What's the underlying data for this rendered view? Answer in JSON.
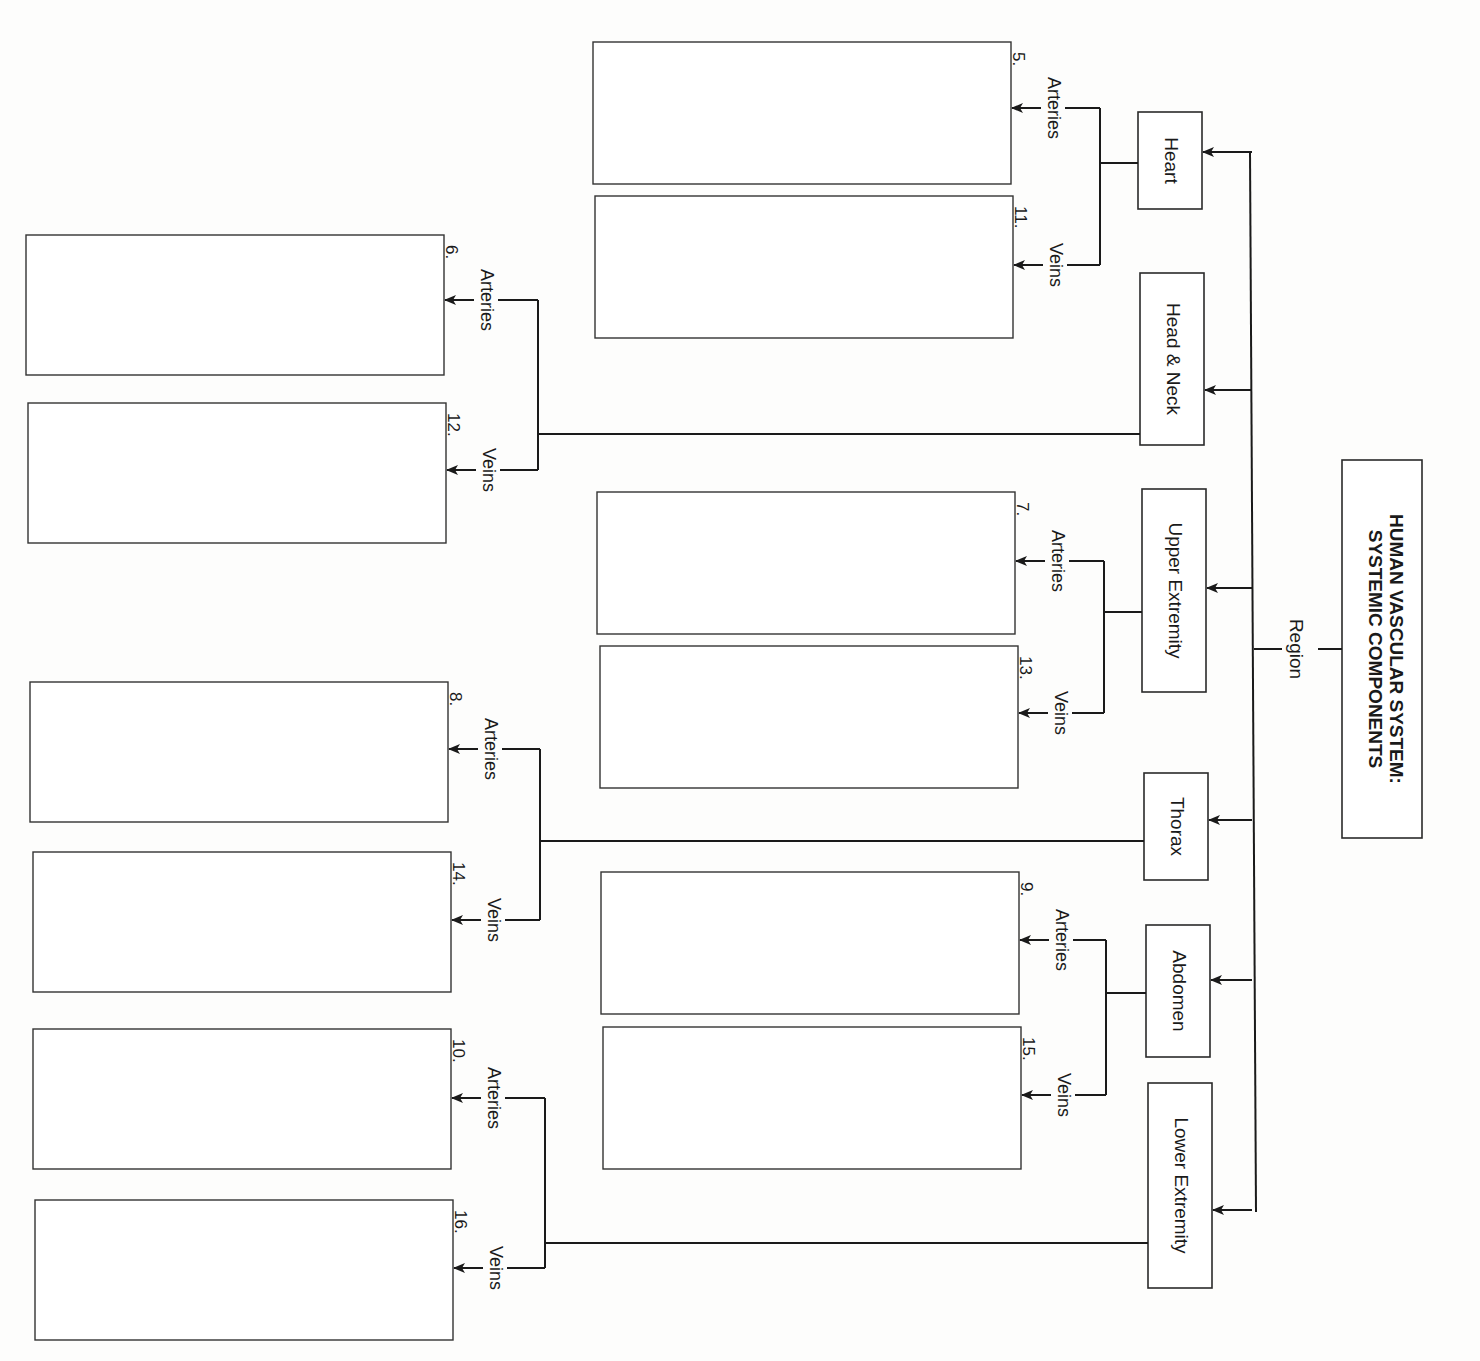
{
  "title": {
    "line1": "HUMAN VASCULAR SYSTEM:",
    "line2": "SYSTEMIC COMPONENTS"
  },
  "root_label": "Region",
  "regions": [
    {
      "name": "Heart",
      "arteries": {
        "label": "Arteries",
        "number": "5."
      },
      "veins": {
        "label": "Veins",
        "number": "11."
      }
    },
    {
      "name": "Head & Neck",
      "arteries": {
        "label": "Arteries",
        "number": "6."
      },
      "veins": {
        "label": "Veins",
        "number": "12."
      }
    },
    {
      "name": "Upper Extremity",
      "arteries": {
        "label": "Arteries",
        "number": "7."
      },
      "veins": {
        "label": "Veins",
        "number": "13."
      }
    },
    {
      "name": "Thorax",
      "arteries": {
        "label": "Arteries",
        "number": "8."
      },
      "veins": {
        "label": "Veins",
        "number": "14."
      }
    },
    {
      "name": "Abdomen",
      "arteries": {
        "label": "Arteries",
        "number": "9."
      },
      "veins": {
        "label": "Veins",
        "number": "15."
      }
    },
    {
      "name": "Lower Extremity",
      "arteries": {
        "label": "Arteries",
        "number": "10."
      },
      "veins": {
        "label": "Veins",
        "number": "16."
      }
    }
  ]
}
